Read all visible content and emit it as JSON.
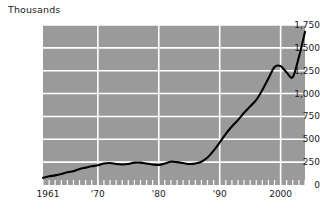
{
  "chart_data": {
    "type": "line",
    "title": "Thousands",
    "xlabel": "",
    "ylabel": "Thousands",
    "grid": true,
    "legend": "none",
    "xlim": [
      1961,
      2004
    ],
    "ylim": [
      0,
      1750
    ],
    "ytick_labels": [
      "1,750",
      "1,500",
      "1,250",
      "1,000",
      "750",
      "500",
      "250",
      "0"
    ],
    "ytick_values": [
      1750,
      1500,
      1250,
      1000,
      750,
      500,
      250,
      0
    ],
    "xtick_labels": [
      "1961",
      "'70",
      "'80",
      "'90",
      "2000"
    ],
    "xtick_values": [
      1961,
      1970,
      1980,
      1990,
      2000
    ],
    "series_name": "value",
    "x": [
      1961,
      1962,
      1963,
      1964,
      1965,
      1966,
      1967,
      1968,
      1969,
      1970,
      1971,
      1972,
      1973,
      1974,
      1975,
      1976,
      1977,
      1978,
      1979,
      1980,
      1981,
      1982,
      1983,
      1984,
      1985,
      1986,
      1987,
      1988,
      1989,
      1990,
      1991,
      1992,
      1993,
      1994,
      1995,
      1996,
      1997,
      1998,
      1999,
      2000,
      2001,
      2002,
      2003,
      2004
    ],
    "values": [
      80,
      95,
      105,
      120,
      140,
      150,
      175,
      190,
      205,
      215,
      235,
      240,
      230,
      225,
      230,
      245,
      245,
      235,
      225,
      220,
      235,
      255,
      250,
      240,
      230,
      235,
      255,
      300,
      375,
      465,
      560,
      640,
      710,
      790,
      860,
      930,
      1040,
      1165,
      1290,
      1300,
      1230,
      1180,
      1400,
      1675
    ],
    "background_color": "#9a9a9a",
    "gridline_color": "#ffffff",
    "line_color": "#000000",
    "page_background": "#ffffff"
  }
}
